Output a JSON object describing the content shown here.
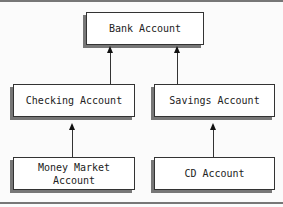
{
  "diagram": {
    "type": "class-hierarchy",
    "nodes": [
      {
        "id": "bank",
        "label": "Bank Account"
      },
      {
        "id": "checking",
        "label": "Checking Account"
      },
      {
        "id": "savings",
        "label": "Savings Account"
      },
      {
        "id": "money_market",
        "label_line1": "Money Market",
        "label_line2": "Account"
      },
      {
        "id": "cd",
        "label": "CD Account"
      }
    ],
    "edges": [
      {
        "from": "checking",
        "to": "bank"
      },
      {
        "from": "savings",
        "to": "bank"
      },
      {
        "from": "money_market",
        "to": "checking"
      },
      {
        "from": "cd",
        "to": "savings"
      }
    ]
  }
}
